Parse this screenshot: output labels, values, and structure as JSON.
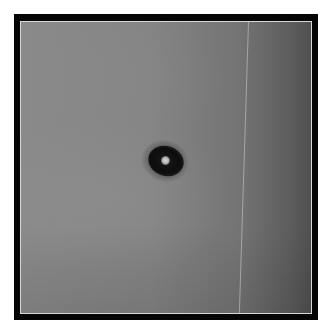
{
  "image": {
    "kind": "grayscale microscopy photograph",
    "subject": "single dark particle with bright center",
    "frame": {
      "outer_border_color": "#050505",
      "inner_border_color": "#d8d8d8",
      "page_background": "#ffffff"
    },
    "field": {
      "left_tone": "#8a8a8a",
      "right_tone": "#505050"
    },
    "particle": {
      "ring_color": "#0c0c0c",
      "core_color": "#d8d8d8"
    },
    "artifacts": {
      "vertical_scan_line": true
    }
  },
  "caption": ""
}
